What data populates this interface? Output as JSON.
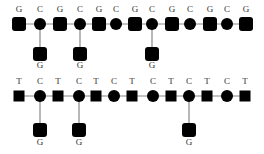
{
  "diagram": {
    "colors": {
      "node": "#000000",
      "edge": "#888888",
      "label": "#333333",
      "background": "#ffffff"
    },
    "top_chain": {
      "line_y": 24,
      "label_y": 12,
      "nodes": [
        {
          "label": "G",
          "shape": "rounded-square",
          "x": 19
        },
        {
          "label": "C",
          "shape": "circle",
          "x": 40
        },
        {
          "label": "G",
          "shape": "rounded-square",
          "x": 60
        },
        {
          "label": "C",
          "shape": "circle",
          "x": 80
        },
        {
          "label": "G",
          "shape": "rounded-square",
          "x": 99
        },
        {
          "label": "C",
          "shape": "circle",
          "x": 116
        },
        {
          "label": "G",
          "shape": "rounded-square",
          "x": 135
        },
        {
          "label": "C",
          "shape": "circle",
          "x": 152
        },
        {
          "label": "G",
          "shape": "rounded-square",
          "x": 172
        },
        {
          "label": "C",
          "shape": "circle",
          "x": 190
        },
        {
          "label": "G",
          "shape": "rounded-square",
          "x": 210
        },
        {
          "label": "C",
          "shape": "circle",
          "x": 227
        },
        {
          "label": "G",
          "shape": "rounded-square",
          "x": 246
        }
      ],
      "branches": [
        {
          "x": 40,
          "label": "G",
          "node_y": 54,
          "label_y": 68
        },
        {
          "x": 80,
          "label": "G",
          "node_y": 54,
          "label_y": 68
        },
        {
          "x": 152,
          "label": "G",
          "node_y": 54,
          "label_y": 68
        }
      ]
    },
    "bottom_chain": {
      "line_y": 96,
      "label_y": 84,
      "nodes": [
        {
          "label": "T",
          "shape": "square",
          "x": 19
        },
        {
          "label": "C",
          "shape": "circle",
          "x": 40
        },
        {
          "label": "T",
          "shape": "square",
          "x": 58
        },
        {
          "label": "C",
          "shape": "circle",
          "x": 79
        },
        {
          "label": "T",
          "shape": "square",
          "x": 96
        },
        {
          "label": "C",
          "shape": "circle",
          "x": 114
        },
        {
          "label": "T",
          "shape": "square",
          "x": 132
        },
        {
          "label": "C",
          "shape": "circle",
          "x": 153
        },
        {
          "label": "T",
          "shape": "square",
          "x": 171
        },
        {
          "label": "C",
          "shape": "circle",
          "x": 189
        },
        {
          "label": "T",
          "shape": "square",
          "x": 207
        },
        {
          "label": "C",
          "shape": "circle",
          "x": 227
        },
        {
          "label": "T",
          "shape": "square",
          "x": 245
        }
      ],
      "branches": [
        {
          "x": 40,
          "label": "G",
          "node_y": 130,
          "label_y": 145
        },
        {
          "x": 79,
          "label": "G",
          "node_y": 130,
          "label_y": 145
        },
        {
          "x": 189,
          "label": "G",
          "node_y": 130,
          "label_y": 145
        }
      ]
    }
  }
}
